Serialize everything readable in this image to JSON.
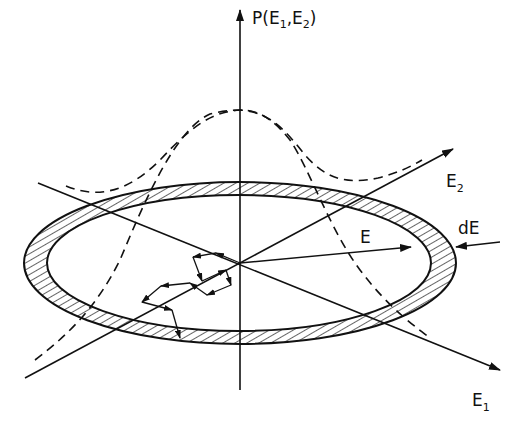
{
  "diagram": {
    "type": "energy-shell-probability",
    "colors": {
      "ink": "#111111",
      "background": "#ffffff"
    },
    "axes": {
      "vertical": {
        "label_main": "P(E",
        "label_sub1": "1",
        "label_mid": ",E",
        "label_sub2": "2",
        "label_end": ")"
      },
      "e1": {
        "label_main": "E",
        "label_sub": "1"
      },
      "e2": {
        "label_main": "E",
        "label_sub": "2"
      }
    },
    "annotations": {
      "radius_label": "E",
      "shell_width_label": "dE"
    },
    "elements": {
      "shell": "hatched elliptical annulus (energy shell)",
      "distribution": "dashed Gaussian-like curves P(E1,E2) peaking at origin",
      "random_walk": "zig-zag arrowed path inside the shell"
    }
  }
}
